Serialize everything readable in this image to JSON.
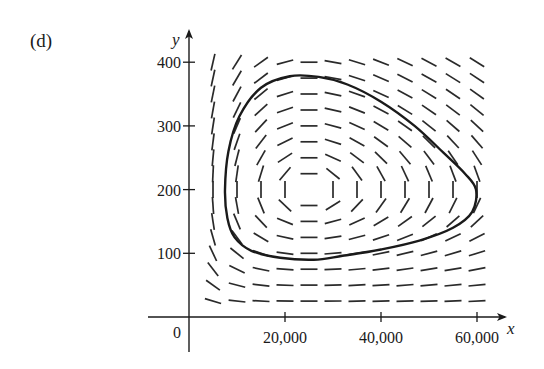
{
  "panel_label": "(d)",
  "chart_data": {
    "type": "direction-field",
    "title": "",
    "panel": "(d)",
    "xlabel": "x",
    "ylabel": "y",
    "xlim": [
      0,
      62000
    ],
    "ylim": [
      0,
      420
    ],
    "origin_label": "0",
    "x_ticks": [
      {
        "value": 20000,
        "label": "20,000"
      },
      {
        "value": 40000,
        "label": "40,000"
      },
      {
        "value": 60000,
        "label": "60,000"
      }
    ],
    "y_ticks": [
      {
        "value": 100,
        "label": "100"
      },
      {
        "value": 200,
        "label": "200"
      },
      {
        "value": 300,
        "label": "300"
      },
      {
        "value": 400,
        "label": "400"
      }
    ],
    "grid": false,
    "legend": null,
    "model": {
      "description": "Predator-prey (Lotka-Volterra) direction field",
      "dxdt": "0.4*x - 0.002*x*y",
      "dydt": "-0.2*y + 0.000008*x*y",
      "equilibrium": {
        "x": 25000,
        "y": 200
      }
    },
    "field_grid": {
      "x_values": [
        5000,
        10000,
        15000,
        20000,
        25000,
        30000,
        35000,
        40000,
        45000,
        50000,
        55000,
        60000
      ],
      "y_values": [
        25,
        50,
        75,
        100,
        125,
        150,
        175,
        200,
        225,
        250,
        275,
        300,
        325,
        350,
        375,
        400
      ]
    },
    "trajectory": {
      "closed": true,
      "points": [
        [
          7500,
          200
        ],
        [
          8200,
          260
        ],
        [
          10500,
          315
        ],
        [
          15000,
          360
        ],
        [
          21000,
          378
        ],
        [
          27000,
          377
        ],
        [
          33000,
          365
        ],
        [
          40000,
          338
        ],
        [
          47000,
          300
        ],
        [
          53000,
          258
        ],
        [
          57500,
          225
        ],
        [
          59800,
          200
        ],
        [
          59000,
          165
        ],
        [
          55000,
          140
        ],
        [
          48000,
          120
        ],
        [
          40000,
          106
        ],
        [
          32000,
          96
        ],
        [
          26000,
          90
        ],
        [
          19000,
          93
        ],
        [
          13000,
          104
        ],
        [
          9500,
          125
        ],
        [
          8000,
          155
        ]
      ]
    }
  }
}
